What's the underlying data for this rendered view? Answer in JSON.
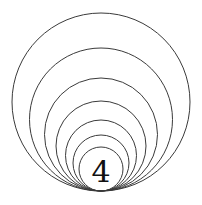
{
  "figure": {
    "background_color": "#ffffff",
    "stroke_color": "#3a3a3a",
    "stroke_width": 1,
    "label": {
      "text": "4",
      "color": "#111111",
      "font_size": 30,
      "x": 101,
      "y": 182
    },
    "tangent_point": {
      "x": 101,
      "y": 191
    },
    "circles": [
      {
        "cx": 101,
        "cy": 102,
        "r": 89
      },
      {
        "cx": 101,
        "cy": 119.5,
        "r": 71.5
      },
      {
        "cx": 101,
        "cy": 134.5,
        "r": 56.5
      },
      {
        "cx": 101,
        "cy": 146,
        "r": 45
      },
      {
        "cx": 101,
        "cy": 155.5,
        "r": 35.5
      },
      {
        "cx": 101,
        "cy": 163,
        "r": 28
      },
      {
        "cx": 101,
        "cy": 169,
        "r": 22
      }
    ]
  },
  "chart_data": {
    "type": "scatter",
    "xlabel": "",
    "ylabel": "",
    "annotations": [
      "4"
    ],
    "circle_count": 7,
    "diameters": [
      178,
      143,
      113,
      90,
      71,
      56,
      44
    ],
    "common_tangent_y": 191
  }
}
